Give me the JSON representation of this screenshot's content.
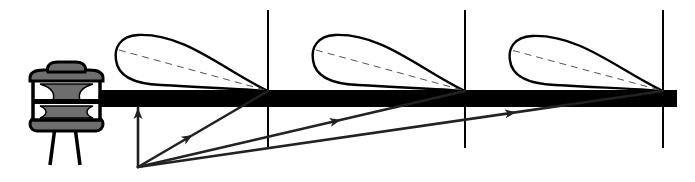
{
  "diagram": {
    "title": "",
    "colors": {
      "line": "#000000",
      "ray": "#222222",
      "insulator_fill": "#6e6e6e",
      "dashed": "#555555",
      "background": "#ffffff"
    },
    "conductor_bar": {
      "x1": 100,
      "x2": 677,
      "y_top": 90,
      "y_bottom": 107
    },
    "vertical_lines": [
      {
        "x": 268,
        "y1": 10,
        "y2": 148
      },
      {
        "x": 465,
        "y1": 10,
        "y2": 148
      },
      {
        "x": 663,
        "y1": 10,
        "y2": 148
      }
    ],
    "lobes": [
      {
        "tip_x": 268,
        "tip_y": 91,
        "left_x": 116,
        "top_y": 35,
        "bottom_y": 85
      },
      {
        "tip_x": 465,
        "tip_y": 91,
        "left_x": 313,
        "top_y": 35,
        "bottom_y": 85
      },
      {
        "tip_x": 663,
        "tip_y": 91,
        "left_x": 510,
        "top_y": 36,
        "bottom_y": 85
      }
    ],
    "origin": {
      "x": 138,
      "y": 167
    },
    "rays": [
      {
        "to_x": 138,
        "to_y": 108,
        "arrow_at": 1.0
      },
      {
        "to_x": 268,
        "to_y": 91,
        "arrow_at": 0.42
      },
      {
        "to_x": 465,
        "to_y": 91,
        "arrow_at": 0.62
      },
      {
        "to_x": 663,
        "to_y": 91,
        "arrow_at": 0.72
      }
    ],
    "insulator": {
      "x": 30,
      "y": 62,
      "width": 73,
      "height": 103
    }
  }
}
